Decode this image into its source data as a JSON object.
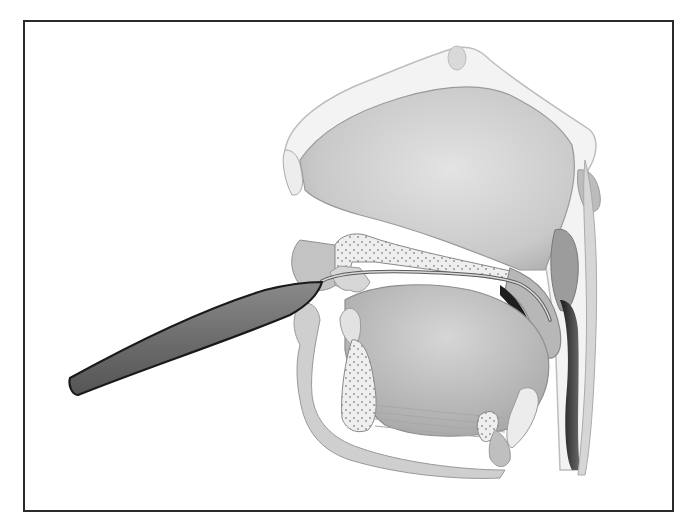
{
  "figure": {
    "type": "anatomical-illustration",
    "view": "sagittal section of head and neck",
    "style": "grayscale pencil shading",
    "frame": {
      "border_color": "#2a2a2a",
      "background": "#ffffff"
    },
    "elements": [
      {
        "name": "instrument-handle",
        "color": "#6f6f6f"
      },
      {
        "name": "instrument-wire",
        "color": "#bdbdbd"
      },
      {
        "name": "nasal-cavity"
      },
      {
        "name": "hard-palate"
      },
      {
        "name": "soft-palate"
      },
      {
        "name": "tongue"
      },
      {
        "name": "mandible"
      },
      {
        "name": "hyoid"
      },
      {
        "name": "epiglottis"
      },
      {
        "name": "pharynx"
      }
    ]
  }
}
